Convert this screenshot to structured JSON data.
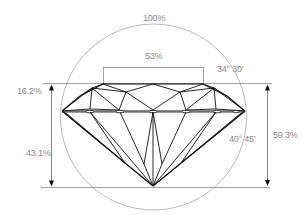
{
  "diagram": {
    "labels": {
      "diameter": "100%",
      "table": "53%",
      "crown_angle": "34° 30'",
      "crown_height": "16.2%",
      "pavilion_depth": "43.1%",
      "pavilion_angle": "40° 45'",
      "total_depth": "59.3%"
    },
    "colors": {
      "facet_lines": "#111111",
      "guide_lines": "#8a8a8a",
      "text": "#8a8a8a",
      "background": "#ffffff"
    }
  }
}
